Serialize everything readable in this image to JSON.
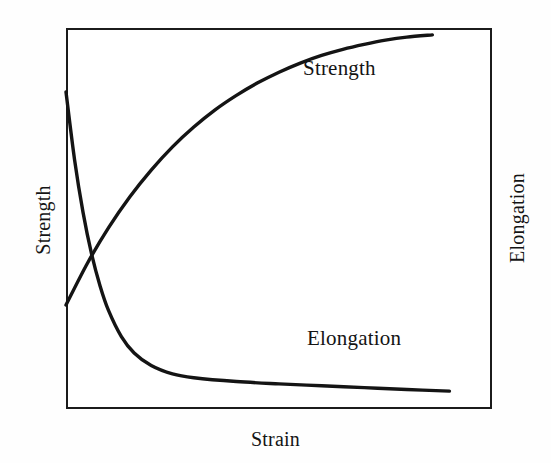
{
  "figure": {
    "background_color": "#fefefe",
    "ink_color": "#141414",
    "frame_color": "#1b1b1b"
  },
  "axes": {
    "x_label": "Strain",
    "y_label_left": "Strength",
    "y_label_right": "Elongation"
  },
  "annotations": {
    "strength_label": "Strength",
    "elongation_label": "Elongation"
  },
  "chart_data": {
    "type": "line",
    "title": "",
    "subtitle": "",
    "xlabel": "Strain",
    "ylabel": "Strength",
    "ylabel_secondary": "Elongation",
    "grid": false,
    "legend": "inline-annotations",
    "axis_ticks": false,
    "axis_tick_labels": false,
    "xlim": [
      0,
      1
    ],
    "ylim": [
      0,
      1
    ],
    "annotations": [
      {
        "text": "Strength",
        "x": 0.68,
        "y": 0.9,
        "series": "Strength"
      },
      {
        "text": "Elongation",
        "x": 0.72,
        "y": 0.19,
        "series": "Elongation"
      }
    ],
    "crossover_point": {
      "x": 0.052,
      "y": 0.37
    },
    "series": [
      {
        "name": "Strength",
        "axis": "left",
        "color": "#141414",
        "line_width": 3,
        "shape": "saturating-exponential-rise",
        "x": [
          0.0,
          0.05,
          0.1,
          0.15,
          0.2,
          0.25,
          0.3,
          0.35,
          0.4,
          0.45,
          0.5,
          0.55,
          0.6,
          0.65,
          0.7,
          0.75,
          0.8,
          0.86
        ],
        "y": [
          0.273,
          0.382,
          0.476,
          0.557,
          0.627,
          0.688,
          0.74,
          0.785,
          0.823,
          0.856,
          0.884,
          0.908,
          0.928,
          0.944,
          0.957,
          0.968,
          0.976,
          0.982
        ]
      },
      {
        "name": "Elongation",
        "axis": "right",
        "color": "#141414",
        "line_width": 3,
        "shape": "decaying-exponential-fall",
        "x": [
          0.0,
          0.02,
          0.04,
          0.06,
          0.08,
          0.1,
          0.13,
          0.16,
          0.2,
          0.25,
          0.3,
          0.4,
          0.5,
          0.6,
          0.7,
          0.8,
          0.9
        ],
        "y": [
          0.832,
          0.655,
          0.516,
          0.407,
          0.323,
          0.258,
          0.19,
          0.147,
          0.114,
          0.092,
          0.082,
          0.072,
          0.066,
          0.061,
          0.056,
          0.051,
          0.047
        ]
      }
    ]
  }
}
